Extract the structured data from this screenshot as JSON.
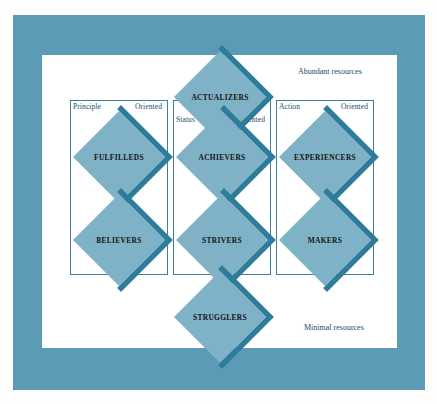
{
  "diagram": {
    "colors": {
      "frame": "#5b9bb5",
      "canvas": "#ffffff",
      "diamond_fill": "#7fb2c6",
      "diamond_shadow": "#2e7c99",
      "box_stroke": "#3f7f97",
      "label_text": "#1d4a5e",
      "diamond_text": "#141414"
    },
    "resources": {
      "top": "Abundant resources",
      "bottom": "Minimal resources"
    },
    "orientation_boxes": [
      {
        "id": "principle",
        "left_label": "Principle",
        "right_label": "Oriented"
      },
      {
        "id": "status",
        "left_label": "Status",
        "right_label": "Oriented"
      },
      {
        "id": "action",
        "left_label": "Action",
        "right_label": "Oriented"
      }
    ],
    "segments": [
      {
        "id": "actualizers",
        "label": "ACTUALIZERS",
        "row": "top",
        "column": "center"
      },
      {
        "id": "fulfilleds",
        "label": "FULFILLEDS",
        "row": "upper-middle",
        "column": "left"
      },
      {
        "id": "achievers",
        "label": "ACHIEVERS",
        "row": "upper-middle",
        "column": "center"
      },
      {
        "id": "experiencers",
        "label": "EXPERIENCERS",
        "row": "upper-middle",
        "column": "right"
      },
      {
        "id": "believers",
        "label": "BELIEVERS",
        "row": "lower-middle",
        "column": "left"
      },
      {
        "id": "strivers",
        "label": "STRIVERS",
        "row": "lower-middle",
        "column": "center"
      },
      {
        "id": "makers",
        "label": "MAKERS",
        "row": "lower-middle",
        "column": "right"
      },
      {
        "id": "strugglers",
        "label": "STRUGGLERS",
        "row": "bottom",
        "column": "center"
      }
    ]
  }
}
